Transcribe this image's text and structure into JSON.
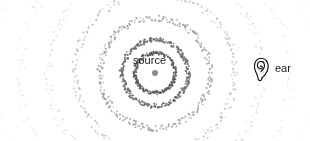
{
  "diagram": {
    "background_color": "#ffffff",
    "width": 310,
    "height": 141
  },
  "source": {
    "label": "source",
    "icon_name": "source-point-dot",
    "center_x": 155,
    "center_y": 73,
    "dot_radius": 3,
    "dot_color": "#8c8c8c"
  },
  "ear": {
    "label": "ear",
    "icon_name": "ear-icon",
    "icon_x": 252,
    "icon_y": 55,
    "stroke_color": "#111111"
  },
  "chart_data": {
    "type": "scatter",
    "xlabel": "",
    "ylabel": "",
    "center": [
      155,
      73
    ],
    "grid": false,
    "legend": null,
    "annotations": [
      "source",
      "ear"
    ],
    "rings": [
      {
        "index": 1,
        "radius": 20,
        "dot_count": 150,
        "dot_size": 1.05,
        "color": "#5e5e5e",
        "jitter": 1.6,
        "opacity": 1.0
      },
      {
        "index": 2,
        "radius": 33,
        "dot_count": 230,
        "dot_size": 1.0,
        "color": "#6e6e6e",
        "jitter": 2.2,
        "opacity": 0.96
      },
      {
        "index": 3,
        "radius": 55,
        "dot_count": 250,
        "dot_size": 0.95,
        "color": "#9a9a9a",
        "jitter": 3.0,
        "opacity": 0.85
      },
      {
        "index": 4,
        "radius": 80,
        "dot_count": 230,
        "dot_size": 0.9,
        "color": "#b4b4b4",
        "jitter": 3.6,
        "opacity": 0.72
      },
      {
        "index": 5,
        "radius": 107,
        "dot_count": 210,
        "dot_size": 0.85,
        "color": "#c6c6c6",
        "jitter": 4.2,
        "opacity": 0.6
      },
      {
        "index": 6,
        "radius": 135,
        "dot_count": 190,
        "dot_size": 0.8,
        "color": "#d4d4d4",
        "jitter": 4.6,
        "opacity": 0.5
      },
      {
        "index": 7,
        "radius": 163,
        "dot_count": 170,
        "dot_size": 0.8,
        "color": "#dedede",
        "jitter": 5.0,
        "opacity": 0.42
      }
    ]
  }
}
